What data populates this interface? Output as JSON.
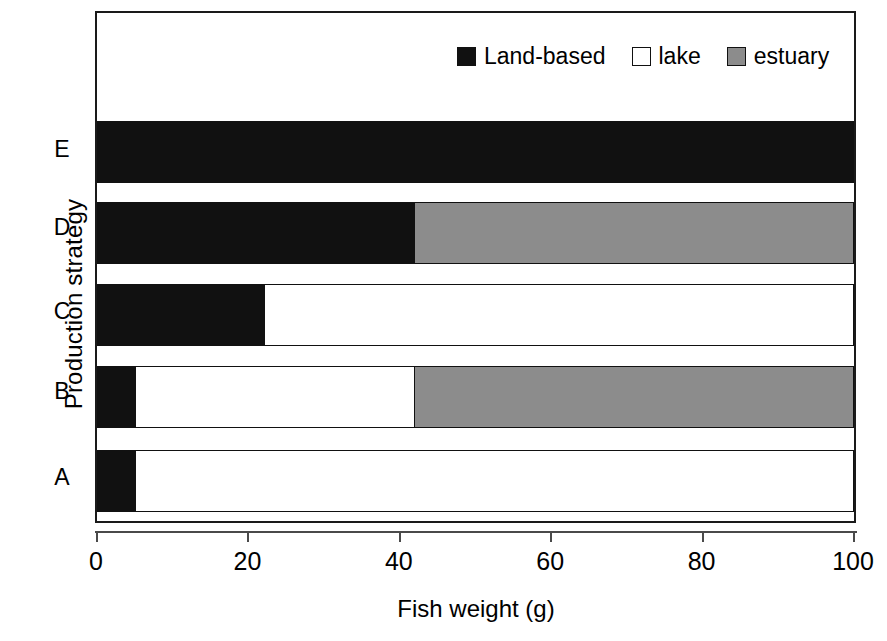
{
  "chart_data": {
    "type": "bar",
    "orientation": "horizontal",
    "stacked": true,
    "title": "",
    "xlabel": "Fish weight (g)",
    "ylabel": "Production strategy",
    "xlim": [
      0,
      100
    ],
    "xticks": [
      0,
      20,
      40,
      60,
      80,
      100
    ],
    "xtick_labels": [
      "0",
      "20",
      "40",
      "60",
      "80",
      "100"
    ],
    "grid": false,
    "legend_position": "top-right",
    "categories": [
      "A",
      "B",
      "C",
      "D",
      "E"
    ],
    "category_order_top_to_bottom": [
      "E",
      "D",
      "C",
      "B",
      "A"
    ],
    "series": [
      {
        "name": "Land-based",
        "color": "#111111",
        "values": [
          5,
          5,
          22,
          42,
          100
        ]
      },
      {
        "name": "lake",
        "color": "#ffffff",
        "values": [
          95,
          37,
          78,
          0,
          0
        ]
      },
      {
        "name": "estuary",
        "color": "#8c8c8c",
        "values": [
          0,
          58,
          0,
          58,
          0
        ]
      }
    ]
  },
  "legend": {
    "items": [
      {
        "label": "Land-based",
        "swatch": "legend-swatch-black"
      },
      {
        "label": "lake",
        "swatch": "legend-swatch-white"
      },
      {
        "label": "estuary",
        "swatch": "legend-swatch-gray"
      }
    ]
  },
  "axes": {
    "x_title": "Fish weight (g)",
    "y_title": "Production strategy",
    "x_tick_labels": [
      "0",
      "20",
      "40",
      "60",
      "80",
      "100"
    ],
    "y_tick_labels_top_to_bottom": [
      "E",
      "D",
      "C",
      "B",
      "A"
    ]
  },
  "colors": {
    "land_based": "#111111",
    "lake": "#ffffff",
    "estuary": "#8c8c8c",
    "frame": "#1a1a1a",
    "axis": "#4a4a4a",
    "background": "#ffffff"
  }
}
